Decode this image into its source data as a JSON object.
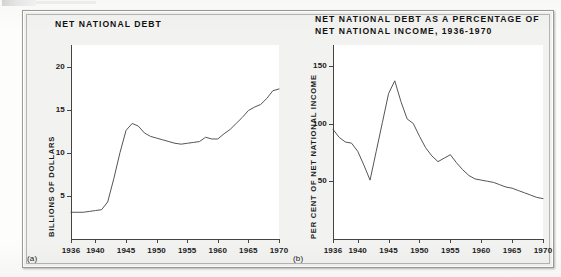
{
  "figure": {
    "panel_a_letter": "(a)",
    "panel_b_letter": "(b)"
  },
  "panel_a": {
    "title": "NET NATIONAL DEBT",
    "ylabel": "BILLIONS OF DOLLARS"
  },
  "panel_b": {
    "title": "NET NATIONAL DEBT AS A PERCENTAGE OF\nNET NATIONAL INCOME, 1936-1970",
    "ylabel": "PER CENT OF NET NATIONAL INCOME"
  },
  "chart_data": [
    {
      "type": "line",
      "panel": "(a)",
      "title": "NET NATIONAL DEBT",
      "xlabel": "",
      "ylabel": "BILLIONS OF DOLLARS",
      "xlim": [
        1936,
        1970
      ],
      "ylim": [
        0,
        22.5
      ],
      "grid": false,
      "legend": false,
      "xticks": [
        1936,
        1940,
        1945,
        1950,
        1955,
        1960,
        1965,
        1970
      ],
      "xtick_labels": [
        "1936",
        "1940",
        "1945",
        "1950",
        "1955",
        "1960",
        "1965",
        "1970"
      ],
      "yticks": [
        5,
        10,
        15,
        20
      ],
      "ytick_labels": [
        "5",
        "10",
        "15",
        "20"
      ],
      "x": [
        1936,
        1937,
        1938,
        1939,
        1940,
        1941,
        1942,
        1943,
        1944,
        1945,
        1946,
        1947,
        1948,
        1949,
        1950,
        1951,
        1952,
        1953,
        1954,
        1955,
        1956,
        1957,
        1958,
        1959,
        1960,
        1961,
        1962,
        1963,
        1964,
        1965,
        1966,
        1967,
        1968,
        1969,
        1970
      ],
      "values": [
        3.1,
        3.1,
        3.1,
        3.2,
        3.3,
        3.4,
        4.3,
        7.0,
        10.0,
        12.6,
        13.4,
        13.1,
        12.3,
        11.9,
        11.7,
        11.5,
        11.3,
        11.1,
        11.0,
        11.1,
        11.2,
        11.3,
        11.8,
        11.6,
        11.6,
        12.2,
        12.7,
        13.4,
        14.1,
        14.9,
        15.3,
        15.6,
        16.3,
        17.2,
        17.4
      ]
    },
    {
      "type": "line",
      "panel": "(b)",
      "title": "NET NATIONAL DEBT AS A PERCENTAGE OF NET NATIONAL INCOME, 1936-1970",
      "xlabel": "",
      "ylabel": "PER CENT OF NET NATIONAL INCOME",
      "xlim": [
        1936,
        1970
      ],
      "ylim": [
        0,
        168
      ],
      "grid": false,
      "legend": false,
      "xticks": [
        1936,
        1940,
        1945,
        1950,
        1955,
        1960,
        1965,
        1970
      ],
      "xtick_labels": [
        "1936",
        "1940",
        "1945",
        "1950",
        "1955",
        "1960",
        "1965",
        "1970"
      ],
      "yticks": [
        50,
        100,
        150
      ],
      "ytick_labels": [
        "50",
        "100",
        "150"
      ],
      "x": [
        1936,
        1937,
        1938,
        1939,
        1940,
        1941,
        1942,
        1943,
        1944,
        1945,
        1946,
        1947,
        1948,
        1949,
        1950,
        1951,
        1952,
        1953,
        1954,
        1955,
        1956,
        1957,
        1958,
        1959,
        1960,
        1961,
        1962,
        1963,
        1964,
        1965,
        1966,
        1967,
        1968,
        1969,
        1970
      ],
      "values": [
        95,
        88,
        84,
        83,
        76,
        64,
        51,
        76,
        101,
        126,
        137,
        119,
        104,
        100,
        89,
        79,
        72,
        67,
        70,
        73,
        66,
        60,
        55,
        52,
        51,
        50,
        49,
        47,
        45,
        44,
        42,
        40,
        38,
        36,
        35
      ]
    }
  ]
}
